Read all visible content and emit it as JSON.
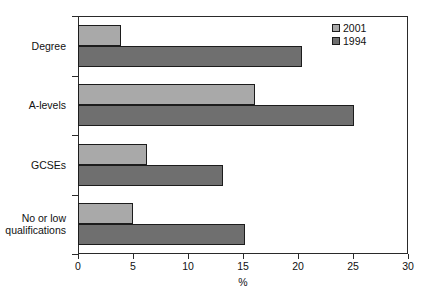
{
  "chart_data": {
    "type": "bar",
    "orientation": "horizontal",
    "title": "",
    "subtitle": "",
    "xlabel": "%",
    "ylabel": "",
    "xlim": [
      0,
      30
    ],
    "xticks": [
      0,
      5,
      10,
      15,
      20,
      25,
      30
    ],
    "xtick_labels": [
      "0",
      "5",
      "10",
      "15",
      "20",
      "25",
      "30"
    ],
    "grid": false,
    "legend_position": "top-right",
    "categories": [
      "Degree",
      "A-levels",
      "GCSEs",
      "No or low\nqualifications"
    ],
    "series": [
      {
        "name": "2001",
        "color": "#a9a9a9",
        "values": [
          3.9,
          16.1,
          6.3,
          5.0
        ]
      },
      {
        "name": "1994",
        "color": "#6f6f6f",
        "values": [
          20.4,
          25.1,
          13.2,
          15.2
        ]
      }
    ]
  },
  "legend": {
    "entries": [
      {
        "label": "2001"
      },
      {
        "label": "1994"
      }
    ]
  },
  "axis": {
    "x_title": "%"
  }
}
